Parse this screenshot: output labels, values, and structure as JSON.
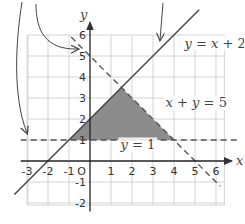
{
  "chart_data": {
    "type": "line",
    "title": "",
    "xlabel": "x",
    "ylabel": "y",
    "origin_label": "O",
    "xlim": [
      -3.3,
      6.7
    ],
    "ylim": [
      -2.3,
      6.6
    ],
    "grid": true,
    "x_ticks": [
      "-3",
      "-2",
      "-1",
      "1",
      "2",
      "3",
      "4",
      "5",
      "6"
    ],
    "x_tick_values": [
      -3,
      -2,
      -1,
      1,
      2,
      3,
      4,
      5,
      6
    ],
    "y_ticks": [
      "6",
      "5",
      "4",
      "3",
      "2",
      "1",
      "-1",
      "-2"
    ],
    "y_tick_values": [
      6,
      5,
      4,
      3,
      2,
      1,
      -1,
      -2
    ],
    "lines": [
      {
        "name": "y = x + 2",
        "equation": "y = x + 2",
        "slope": 1,
        "intercept": 2,
        "style": "solid",
        "x_range": [
          -3.6,
          5.2
        ],
        "color": "#444444"
      },
      {
        "name": "x + y = 5",
        "equation": "x + y = 5",
        "slope": -1,
        "intercept": 5,
        "style": "dashed",
        "x_range": [
          -0.9,
          6.2
        ],
        "color": "#555555"
      },
      {
        "name": "y = 1",
        "equation": "y = 1",
        "slope": 0,
        "intercept": 1,
        "style": "dashed",
        "x_range": [
          -3.3,
          7.0
        ],
        "color": "#555555"
      }
    ],
    "shaded_region": {
      "description": "Triangle bounded by y = x + 2, x + y = 5 and y = 1",
      "vertices": [
        [
          -1,
          1
        ],
        [
          1.5,
          3.5
        ],
        [
          4,
          1
        ]
      ],
      "color": "#8c8c8c"
    },
    "annotations": [
      {
        "text_parts": [
          "y",
          " = ",
          "x",
          " + 2"
        ],
        "near": "upper-right of line y = x + 2"
      },
      {
        "text_parts": [
          "x",
          " + ",
          "y",
          " = 5"
        ],
        "near": "right of shaded triangle"
      },
      {
        "text_parts": [
          "y",
          " = 1"
        ],
        "near": "below line y = 1"
      }
    ],
    "arrows": [
      {
        "description": "curved arrow pointing to y-intercept of x + y = 5 (y = 5)"
      },
      {
        "description": "curved arrow from top-left pointing down to line y = 1 on left"
      },
      {
        "description": "arrow pointing down to line y = x + 2"
      }
    ]
  }
}
